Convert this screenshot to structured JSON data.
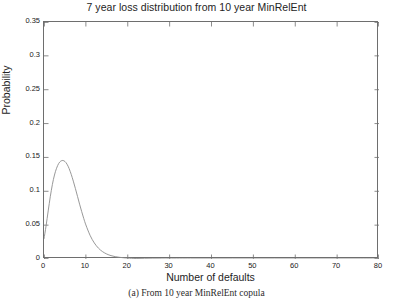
{
  "chart_data": {
    "type": "line",
    "title": "7 year loss distribution from 10 year MinRelEnt",
    "xlabel": "Number of defaults",
    "ylabel": "Probability",
    "caption": "(a) From 10 year MinRelEnt copula",
    "xlim": [
      0,
      80
    ],
    "ylim": [
      0,
      0.35
    ],
    "grid": false,
    "legend": null,
    "line_color": "#8c8c8c",
    "axis_color": "#6e6e6e",
    "xticks": [
      0,
      10,
      20,
      30,
      40,
      50,
      60,
      70,
      80
    ],
    "xtick_labels": [
      "0",
      "10",
      "20",
      "30",
      "40",
      "50",
      "60",
      "70",
      "80"
    ],
    "yticks": [
      0,
      0.05,
      0.1,
      0.15,
      0.2,
      0.25,
      0.3,
      0.35
    ],
    "ytick_labels": [
      "0",
      "0.05",
      "0.1",
      "0.15",
      "0.2",
      "0.25",
      "0.3",
      "0.35"
    ],
    "series": [
      {
        "name": "7 year loss distribution",
        "x": [
          0,
          0.5,
          1,
          1.5,
          2,
          2.5,
          3,
          3.5,
          4,
          4.5,
          5,
          5.5,
          6,
          6.5,
          7,
          7.5,
          8,
          8.5,
          9,
          9.5,
          10,
          11,
          12,
          13,
          14,
          15,
          16,
          17,
          18,
          19,
          20,
          22,
          24,
          26,
          28,
          30,
          35,
          40,
          45,
          50,
          55,
          60,
          65,
          70,
          75,
          80
        ],
        "y": [
          0.03,
          0.049,
          0.071,
          0.092,
          0.11,
          0.124,
          0.134,
          0.141,
          0.1445,
          0.1455,
          0.144,
          0.14,
          0.1335,
          0.125,
          0.115,
          0.104,
          0.0925,
          0.081,
          0.07,
          0.0597,
          0.0503,
          0.035,
          0.0238,
          0.016,
          0.0108,
          0.0073,
          0.005,
          0.0035,
          0.0025,
          0.0018,
          0.0013,
          0.0007,
          0.0004,
          0.0002,
          0.00012,
          7e-05,
          2e-05,
          1e-05,
          5e-06,
          2e-06,
          1e-06,
          5e-07,
          2e-07,
          1e-07,
          5e-08,
          2e-08
        ]
      }
    ],
    "peak": {
      "x": 4.5,
      "y": 0.1455
    }
  }
}
